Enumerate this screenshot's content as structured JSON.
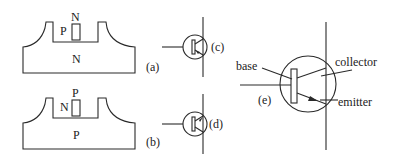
{
  "diagram": {
    "panel_a": {
      "label": "(a)",
      "top_region": "N",
      "left_region": "P",
      "substrate": "N"
    },
    "panel_b": {
      "label": "(b)",
      "top_region": "P",
      "left_region": "N",
      "substrate": "P"
    },
    "symbol_c": {
      "label": "(c)"
    },
    "symbol_d": {
      "label": "(d)"
    },
    "symbol_e": {
      "label": "(e)",
      "base": "base",
      "collector": "collector",
      "emitter": "emitter"
    }
  },
  "colors": {
    "line": "#2a2a2a",
    "background": "#ffffff"
  }
}
